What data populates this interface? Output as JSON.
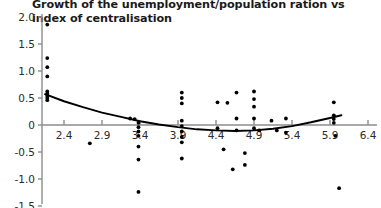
{
  "chart_data": {
    "type": "scatter",
    "title": "Growth of the unemployment/population ration vs index of centralisation",
    "xlabel": "",
    "ylabel": "",
    "xlim": [
      2.15,
      6.55
    ],
    "ylim": [
      -1.55,
      2.1
    ],
    "xticks": [
      "2.4",
      "2.9",
      "3.4",
      "3.9",
      "4.4",
      "4.9",
      "5.4",
      "5.9",
      "6.4"
    ],
    "xtick_values": [
      2.4,
      2.9,
      3.4,
      3.9,
      4.4,
      4.9,
      5.4,
      5.9,
      6.4
    ],
    "yticks": [
      "2.0",
      "1.5",
      "1.0",
      "0.5",
      "0",
      "-0.5",
      "-1.0",
      "-1.5"
    ],
    "ytick_values": [
      2.0,
      1.5,
      1.0,
      0.5,
      0,
      -0.5,
      -1.0,
      -1.5
    ],
    "grid": false,
    "legend": "none",
    "zero_line": true,
    "marker_color": "#000000",
    "axis_color": "#8c8c8c",
    "trend_color": "#000000",
    "points": [
      [
        2.18,
        1.86
      ],
      [
        2.18,
        1.24
      ],
      [
        2.18,
        1.07
      ],
      [
        2.18,
        0.9
      ],
      [
        2.18,
        0.62
      ],
      [
        2.18,
        0.58
      ],
      [
        2.18,
        0.54
      ],
      [
        2.18,
        0.5
      ],
      [
        2.18,
        0.46
      ],
      [
        2.74,
        -0.34
      ],
      [
        3.27,
        0.12
      ],
      [
        3.33,
        0.11
      ],
      [
        3.38,
        0.04
      ],
      [
        3.38,
        -0.04
      ],
      [
        3.38,
        -0.12
      ],
      [
        3.38,
        -0.2
      ],
      [
        3.38,
        -0.4
      ],
      [
        3.38,
        -0.64
      ],
      [
        3.38,
        -1.24
      ],
      [
        3.95,
        0.6
      ],
      [
        3.95,
        0.5
      ],
      [
        3.95,
        0.4
      ],
      [
        3.95,
        0.08
      ],
      [
        3.95,
        -0.02
      ],
      [
        3.95,
        -0.12
      ],
      [
        3.95,
        -0.22
      ],
      [
        3.95,
        -0.32
      ],
      [
        3.95,
        -0.62
      ],
      [
        4.42,
        0.42
      ],
      [
        4.42,
        -0.06
      ],
      [
        4.55,
        0.41
      ],
      [
        4.5,
        -0.45
      ],
      [
        4.62,
        -0.82
      ],
      [
        4.67,
        0.6
      ],
      [
        4.67,
        0.12
      ],
      [
        4.67,
        -0.1
      ],
      [
        4.78,
        -0.52
      ],
      [
        4.78,
        -0.74
      ],
      [
        4.9,
        0.62
      ],
      [
        4.9,
        0.48
      ],
      [
        4.9,
        0.34
      ],
      [
        4.9,
        0.12
      ],
      [
        4.9,
        -0.06
      ],
      [
        4.97,
        -0.1
      ],
      [
        5.13,
        0.08
      ],
      [
        5.2,
        -0.1
      ],
      [
        5.32,
        0.12
      ],
      [
        5.32,
        -0.14
      ],
      [
        5.95,
        0.42
      ],
      [
        5.95,
        0.18
      ],
      [
        5.95,
        0.11
      ],
      [
        5.95,
        0.04
      ],
      [
        5.97,
        -0.2
      ],
      [
        6.02,
        -1.17
      ]
    ],
    "trend": {
      "type": "quadratic",
      "points": [
        [
          2.15,
          0.57
        ],
        [
          2.4,
          0.44
        ],
        [
          2.65,
          0.33
        ],
        [
          2.9,
          0.23
        ],
        [
          3.15,
          0.15
        ],
        [
          3.4,
          0.07
        ],
        [
          3.65,
          0.01
        ],
        [
          3.9,
          -0.04
        ],
        [
          4.15,
          -0.08
        ],
        [
          4.4,
          -0.1
        ],
        [
          4.65,
          -0.11
        ],
        [
          4.9,
          -0.1
        ],
        [
          5.15,
          -0.07
        ],
        [
          5.4,
          -0.02
        ],
        [
          5.65,
          0.05
        ],
        [
          5.9,
          0.13
        ],
        [
          6.05,
          0.18
        ]
      ]
    }
  }
}
